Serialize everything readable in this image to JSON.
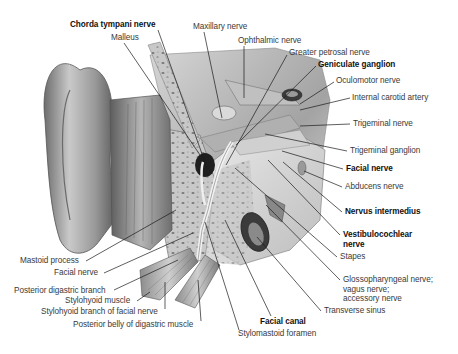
{
  "figure": {
    "colors": {
      "background": "#ffffff",
      "label_text": "#3a3a3a",
      "bold_label_text": "#111111",
      "leader_line": "#1a1a1a"
    },
    "labels": [
      {
        "id": "chorda-tympani-nerve",
        "text": "Chorda tympani nerve",
        "bold": true,
        "x": 70,
        "y": 20
      },
      {
        "id": "malleus",
        "text": "Malleus",
        "bold": false,
        "x": 111,
        "y": 33
      },
      {
        "id": "maxillary-nerve",
        "text": "Maxillary nerve",
        "bold": false,
        "x": 193,
        "y": 22
      },
      {
        "id": "ophthalmic-nerve",
        "text": "Ophthalmic nerve",
        "bold": false,
        "x": 238,
        "y": 36
      },
      {
        "id": "greater-petrosal-nerve",
        "text": "Greater petrosal nerve",
        "bold": false,
        "x": 289,
        "y": 48
      },
      {
        "id": "geniculate-ganglion",
        "text": "Geniculate ganglion",
        "bold": true,
        "x": 318,
        "y": 60
      },
      {
        "id": "oculomotor-nerve",
        "text": "Oculomotor nerve",
        "bold": false,
        "x": 336,
        "y": 76
      },
      {
        "id": "internal-carotid-artery",
        "text": "Internal carotid artery",
        "bold": false,
        "x": 352,
        "y": 93
      },
      {
        "id": "trigeminal-nerve",
        "text": "Trigeminal nerve",
        "bold": false,
        "x": 353,
        "y": 119
      },
      {
        "id": "trigeminal-ganglion",
        "text": "Trigeminal ganglion",
        "bold": false,
        "x": 350,
        "y": 146
      },
      {
        "id": "facial-nerve-right",
        "text": "Facial nerve",
        "bold": true,
        "x": 346,
        "y": 164
      },
      {
        "id": "abducens-nerve",
        "text": "Abducens nerve",
        "bold": false,
        "x": 345,
        "y": 182
      },
      {
        "id": "nervus-intermedius",
        "text": "Nervus intermedius",
        "bold": true,
        "x": 345,
        "y": 207
      },
      {
        "id": "vestibulocochlear-nerve",
        "text": "Vestibulocochlear\nnerve",
        "bold": true,
        "x": 343,
        "y": 230
      },
      {
        "id": "stapes",
        "text": "Stapes",
        "bold": false,
        "x": 340,
        "y": 252
      },
      {
        "id": "glossopharyngeal-vagus-accessory",
        "text": "Glossopharyngeal nerve;\nvagus nerve;\naccessory nerve",
        "bold": false,
        "x": 343,
        "y": 275
      },
      {
        "id": "transverse-sinus",
        "text": "Transverse sinus",
        "bold": false,
        "x": 324,
        "y": 306
      },
      {
        "id": "facial-canal",
        "text": "Facial canal",
        "bold": true,
        "x": 260,
        "y": 317
      },
      {
        "id": "stylomastoid-foramen",
        "text": "Stylomastoid foramen",
        "bold": false,
        "x": 238,
        "y": 329
      },
      {
        "id": "mastoid-process",
        "text": "Mastoid process",
        "bold": false,
        "x": 20,
        "y": 256
      },
      {
        "id": "facial-nerve-left",
        "text": "Facial nerve",
        "bold": false,
        "x": 54,
        "y": 268
      },
      {
        "id": "posterior-digastric-branch",
        "text": "Posterior digastric branch",
        "bold": false,
        "x": 14,
        "y": 286
      },
      {
        "id": "stylohyoid-muscle",
        "text": "Stylohyoid muscle",
        "bold": false,
        "x": 65,
        "y": 296
      },
      {
        "id": "stylohyoid-branch-facial-nerve",
        "text": "Stylohyoid branch of facial nerve",
        "bold": false,
        "x": 41,
        "y": 307
      },
      {
        "id": "posterior-belly-digastric-muscle",
        "text": "Posterior belly of digastric muscle",
        "bold": false,
        "x": 73,
        "y": 320
      }
    ],
    "leader_lines": [
      {
        "label": "chorda-tympani-nerve",
        "x1": 158,
        "y1": 30,
        "x2": 207,
        "y2": 168
      },
      {
        "label": "malleus",
        "x1": 124,
        "y1": 43,
        "x2": 200,
        "y2": 155
      },
      {
        "label": "maxillary-nerve",
        "x1": 204,
        "y1": 32,
        "x2": 222,
        "y2": 118
      },
      {
        "label": "ophthalmic-nerve",
        "x1": 244,
        "y1": 46,
        "x2": 244,
        "y2": 98
      },
      {
        "label": "greater-petrosal-nerve",
        "x1": 287,
        "y1": 55,
        "x2": 226,
        "y2": 165
      },
      {
        "label": "geniculate-ganglion",
        "x1": 316,
        "y1": 66,
        "x2": 236,
        "y2": 145
      },
      {
        "label": "oculomotor-nerve",
        "x1": 334,
        "y1": 82,
        "x2": 300,
        "y2": 104
      },
      {
        "label": "internal-carotid-artery",
        "x1": 350,
        "y1": 98,
        "x2": 300,
        "y2": 110
      },
      {
        "label": "trigeminal-nerve",
        "x1": 350,
        "y1": 124,
        "x2": 300,
        "y2": 126
      },
      {
        "label": "trigeminal-ganglion",
        "x1": 347,
        "y1": 151,
        "x2": 265,
        "y2": 134
      },
      {
        "label": "facial-nerve-right",
        "x1": 343,
        "y1": 169,
        "x2": 282,
        "y2": 151
      },
      {
        "label": "abducens-nerve",
        "x1": 342,
        "y1": 187,
        "x2": 304,
        "y2": 171
      },
      {
        "label": "nervus-intermedius",
        "x1": 342,
        "y1": 212,
        "x2": 283,
        "y2": 162
      },
      {
        "label": "vestibulocochlear-nerve",
        "x1": 340,
        "y1": 235,
        "x2": 268,
        "y2": 160
      },
      {
        "label": "stapes",
        "x1": 337,
        "y1": 257,
        "x2": 235,
        "y2": 168
      },
      {
        "label": "glossopharyngeal-vagus-accessory",
        "x1": 340,
        "y1": 280,
        "x2": 266,
        "y2": 205
      },
      {
        "label": "transverse-sinus",
        "x1": 321,
        "y1": 311,
        "x2": 257,
        "y2": 237
      },
      {
        "label": "facial-canal",
        "x1": 271,
        "y1": 316,
        "x2": 225,
        "y2": 220
      },
      {
        "label": "stylomastoid-foramen",
        "x1": 239,
        "y1": 330,
        "x2": 205,
        "y2": 222
      },
      {
        "label": "mastoid-process",
        "x1": 86,
        "y1": 261,
        "x2": 176,
        "y2": 210
      },
      {
        "label": "facial-nerve-left",
        "x1": 104,
        "y1": 273,
        "x2": 193,
        "y2": 233
      },
      {
        "label": "posterior-digastric-branch",
        "x1": 114,
        "y1": 290,
        "x2": 178,
        "y2": 260
      },
      {
        "label": "stylohyoid-muscle",
        "x1": 137,
        "y1": 301,
        "x2": 150,
        "y2": 292
      },
      {
        "label": "stylohyoid-branch-facial-nerve",
        "x1": 165,
        "y1": 309,
        "x2": 165,
        "y2": 282
      },
      {
        "label": "posterior-belly-digastric-muscle",
        "x1": 201,
        "y1": 321,
        "x2": 198,
        "y2": 280
      }
    ]
  }
}
